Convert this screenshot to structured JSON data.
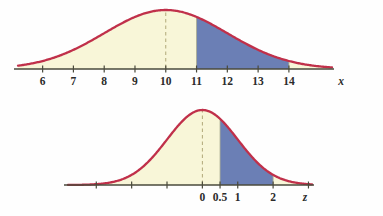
{
  "figure": {
    "credit": "Copyright © Cengage Learning 2013",
    "background": "#fefefe",
    "colors": {
      "curve": "#c0304a",
      "fill_light": "#f8f6d8",
      "fill_shaded": "#6b7fb5",
      "axis": "#4a4a3c",
      "dashed": "#b0a878"
    }
  },
  "chart_data": [
    {
      "type": "area",
      "id": "normal-x-distribution",
      "title": "",
      "xlabel": "x",
      "ylabel": "",
      "grid": false,
      "legend": null,
      "distribution": "normal",
      "mean": 10,
      "sd": 2,
      "xlim": [
        5.2,
        15.4
      ],
      "ylim": [
        0,
        0.21
      ],
      "tick_labels": [
        "6",
        "7",
        "8",
        "9",
        "10",
        "11",
        "12",
        "13",
        "14"
      ],
      "tick_values": [
        6,
        7,
        8,
        9,
        10,
        11,
        12,
        13,
        14
      ],
      "axis_var_label": "x",
      "mean_line": {
        "value": 10,
        "style": "dashed"
      },
      "shaded_region": {
        "from": 11,
        "to": 14,
        "color": "#6b7fb5"
      },
      "base_fill": "#f8f6d8",
      "curve_color": "#c0304a"
    },
    {
      "type": "area",
      "id": "standard-normal-z-distribution",
      "title": "",
      "xlabel": "z",
      "ylabel": "",
      "grid": false,
      "legend": null,
      "distribution": "normal",
      "mean": 0,
      "sd": 1,
      "xlim": [
        -3.8,
        3.1
      ],
      "ylim": [
        0,
        0.42
      ],
      "tick_labels": [
        "0",
        "0.5",
        "1",
        "2"
      ],
      "tick_values": [
        0,
        0.5,
        1,
        2
      ],
      "unlabeled_tick_values": [
        -3,
        -2,
        -1,
        3
      ],
      "axis_var_label": "z",
      "mean_line": {
        "value": 0,
        "style": "dashed"
      },
      "shaded_region": {
        "from": 0.5,
        "to": 2,
        "color": "#6b7fb5"
      },
      "base_fill": "#f8f6d8",
      "curve_color": "#c0304a"
    }
  ]
}
